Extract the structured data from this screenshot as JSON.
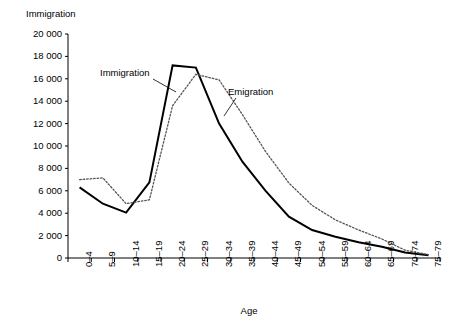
{
  "chart_data": {
    "type": "line",
    "title": "",
    "ylabel": "Immigration",
    "xlabel": "Age",
    "ylim": [
      0,
      20000
    ],
    "ytick_values": [
      0,
      2000,
      4000,
      6000,
      8000,
      10000,
      12000,
      14000,
      16000,
      18000,
      20000
    ],
    "ytick_labels": [
      "0",
      "2 000",
      "4 000",
      "6 000",
      "8 000",
      "10 000",
      "12 000",
      "14 000",
      "16 000",
      "18 000",
      "20 000"
    ],
    "grid": false,
    "legend_position": "inline-annotations",
    "categories": [
      "0–4",
      "5–9",
      "10–14",
      "15–19",
      "20–24",
      "25–29",
      "30–34",
      "35–39",
      "40–44",
      "45–49",
      "50–54",
      "55–59",
      "60–64",
      "65–69",
      "70–74",
      "75–79"
    ],
    "series": [
      {
        "name": "Immigration",
        "style": "solid",
        "color": "#000000",
        "values": [
          6300,
          4850,
          4050,
          6750,
          17200,
          17000,
          12000,
          8600,
          6000,
          3700,
          2500,
          1900,
          1400,
          1000,
          500,
          250
        ]
      },
      {
        "name": "Emigration",
        "style": "dotted",
        "color": "#555555",
        "values": [
          7000,
          7150,
          4850,
          5200,
          13600,
          16400,
          15900,
          12800,
          9500,
          6700,
          4700,
          3400,
          2500,
          1700,
          700,
          300
        ]
      }
    ],
    "annotations": [
      {
        "text": "Immigration",
        "series": "Immigration"
      },
      {
        "text": "Emigration",
        "series": "Emigration"
      }
    ]
  },
  "axis": {
    "y_title": "Immigration",
    "x_title": "Age"
  }
}
